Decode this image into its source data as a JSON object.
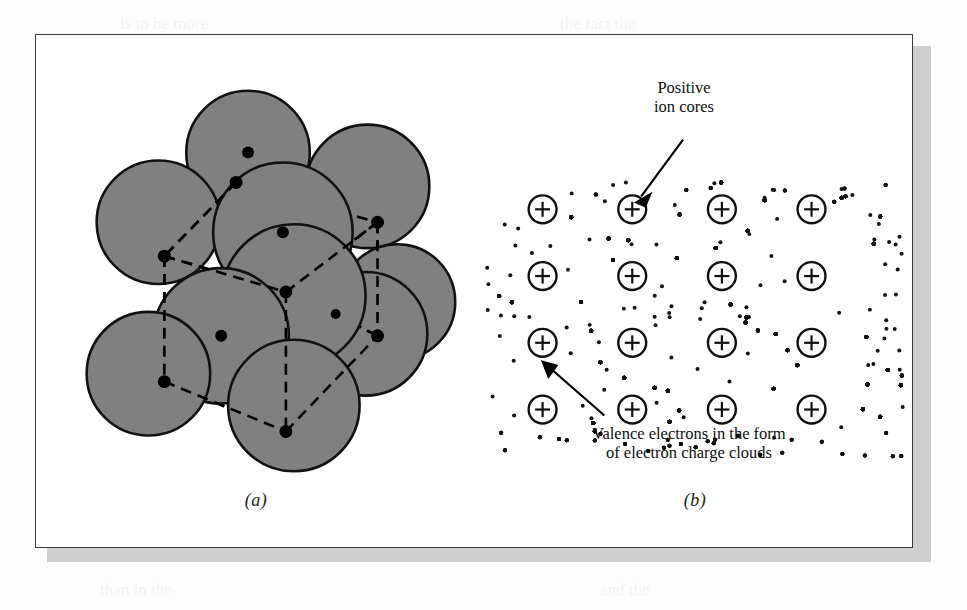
{
  "figure": {
    "panels": [
      {
        "id": "a",
        "caption": "(a)",
        "description": "Hard-sphere atomic packing model with dashed unit cell outline",
        "sphere_fill": "#808080",
        "sphere_stroke": "#111111",
        "center_dot_color": "#000000",
        "dash_color": "#000000",
        "atoms": [
          {
            "cx": 212,
            "cy": 118,
            "r": 62
          },
          {
            "cx": 122,
            "cy": 188,
            "r": 62
          },
          {
            "cx": 332,
            "cy": 152,
            "r": 62
          },
          {
            "cx": 247,
            "cy": 198,
            "r": 70
          },
          {
            "cx": 185,
            "cy": 302,
            "r": 68
          },
          {
            "cx": 258,
            "cy": 262,
            "r": 72
          },
          {
            "cx": 112,
            "cy": 340,
            "r": 62
          },
          {
            "cx": 330,
            "cy": 300,
            "r": 62
          },
          {
            "cx": 362,
            "cy": 268,
            "r": 58
          },
          {
            "cx": 258,
            "cy": 372,
            "r": 66
          },
          {
            "cx": 208,
            "cy": 246,
            "r": 56
          }
        ],
        "cell_vertices": [
          {
            "name": "top-back",
            "x": 200,
            "y": 148
          },
          {
            "name": "right-back",
            "x": 342,
            "y": 188
          },
          {
            "name": "left-back",
            "x": 128,
            "y": 222
          },
          {
            "name": "center-front",
            "x": 250,
            "y": 258
          },
          {
            "name": "left-front",
            "x": 128,
            "y": 348
          },
          {
            "name": "right-front",
            "x": 342,
            "y": 302
          },
          {
            "name": "bottom-front",
            "x": 250,
            "y": 398
          },
          {
            "name": "interior-1",
            "x": 300,
            "y": 280
          }
        ],
        "center_dots": [
          {
            "x": 212,
            "y": 118
          },
          {
            "x": 247,
            "y": 198
          },
          {
            "x": 185,
            "y": 302
          },
          {
            "x": 300,
            "y": 280
          }
        ]
      },
      {
        "id": "b",
        "caption": "(b)",
        "description": "Metallic bonding schematic: positive ion cores in a sea of delocalized valence electrons",
        "ion_core_symbol": "+",
        "ion_core_stroke": "#101010",
        "electron_dot_color": "#111111",
        "ion_core_rows": 4,
        "ion_core_cols": 4,
        "ion_core_radius": 14,
        "grid_origin": {
          "x": 66,
          "y": 175
        },
        "grid_spacing": {
          "x": 90,
          "y": 67
        },
        "annotations": [
          {
            "name": "positive-ion-cores",
            "text": "Positive\nion cores",
            "arrow_from": {
              "x": 207,
              "y": 105
            },
            "arrow_to": {
              "x": 160,
              "y": 166
            }
          },
          {
            "name": "valence-electrons",
            "text": "Valence electrons in the form\nof electron charge clouds",
            "arrow_from": {
              "x": 128,
              "y": 382
            },
            "arrow_to": {
              "x": 66,
              "y": 330
            }
          }
        ]
      }
    ]
  },
  "colors": {
    "sphere_gray": "#808080",
    "outline_black": "#111111",
    "frame_border": "#3a3a3a",
    "page_background": "#fdfdfd",
    "shadow_gray": "#cfcfcf"
  },
  "ghost_text": {
    "lines": [
      "is to be more",
      "the fact the",
      "in the same",
      "bond and the",
      "illustrate",
      "are shown in Fig. 2.9",
      "than in the",
      "and the"
    ]
  }
}
